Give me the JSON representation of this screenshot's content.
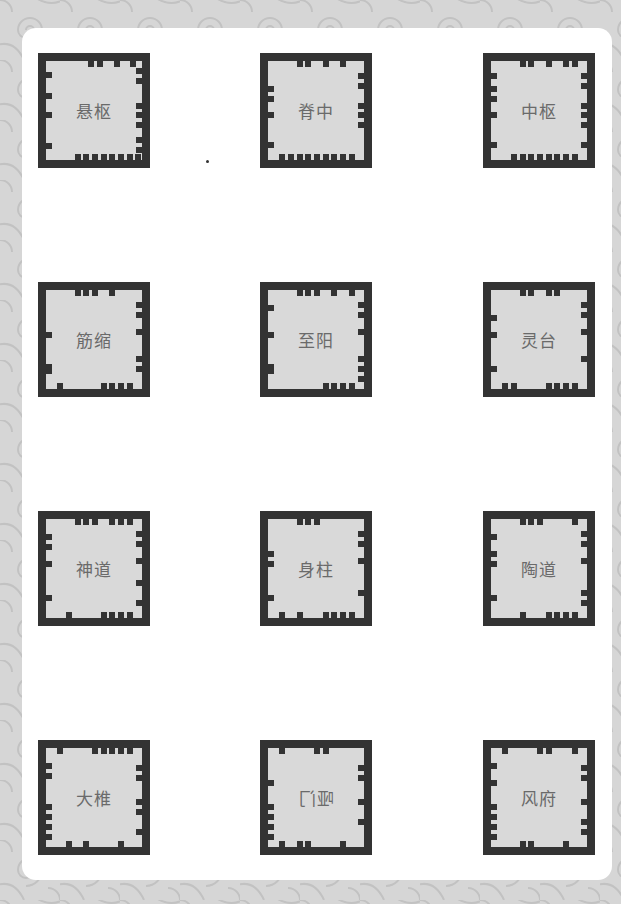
{
  "colors": {
    "background": "#d6d6d6",
    "pattern_stroke": "#c2c2c2",
    "card": "#ffffff",
    "tile_border": "#333333",
    "tile_fill": "#d9d9d9",
    "label_text": "#6a6a6a"
  },
  "grid": {
    "columns": 3,
    "rows": 4,
    "column_lefts": [
      38,
      260,
      483
    ],
    "row_tops": [
      53,
      282,
      511,
      740
    ]
  },
  "tiles": [
    {
      "label": "悬枢",
      "mirrored": false,
      "notches": {
        "top": [
          0.47,
          0.56,
          0.74,
          0.91
        ],
        "bottom": [
          0.33,
          0.42,
          0.51,
          0.6,
          0.69,
          0.78,
          0.87,
          0.96
        ],
        "left": [
          0.14,
          0.35,
          0.55,
          0.86
        ],
        "right": [
          0.1,
          0.2,
          0.45,
          0.55,
          0.65,
          0.8,
          0.9
        ]
      }
    },
    {
      "label": "脊中",
      "mirrored": false,
      "notches": {
        "top": [
          0.33,
          0.42,
          0.6,
          0.78
        ],
        "bottom": [
          0.15,
          0.24,
          0.33,
          0.42,
          0.51,
          0.6,
          0.69,
          0.78,
          0.87
        ],
        "left": [
          0.28,
          0.38,
          0.55,
          0.85
        ],
        "right": [
          0.15,
          0.25,
          0.45,
          0.55,
          0.65
        ]
      }
    },
    {
      "label": "中枢",
      "mirrored": false,
      "notches": {
        "top": [
          0.33,
          0.42,
          0.6,
          0.78,
          0.87
        ],
        "bottom": [
          0.24,
          0.33,
          0.42,
          0.51,
          0.6,
          0.69,
          0.78,
          0.87
        ],
        "left": [
          0.15,
          0.28,
          0.38,
          0.55,
          0.85
        ],
        "right": [
          0.15,
          0.25,
          0.45,
          0.55,
          0.65,
          0.85
        ]
      }
    },
    {
      "label": "筋缩",
      "mirrored": false,
      "notches": {
        "top": [
          0.33,
          0.42,
          0.51,
          0.69
        ],
        "bottom": [
          0.15,
          0.6,
          0.69,
          0.78,
          0.87
        ],
        "left": [
          0.45,
          0.78,
          0.82
        ],
        "right": [
          0.15,
          0.25,
          0.42,
          0.7,
          0.8
        ]
      }
    },
    {
      "label": "至阳",
      "mirrored": false,
      "notches": {
        "top": [
          0.33,
          0.42,
          0.51,
          0.69,
          0.87
        ],
        "bottom": [
          0.6,
          0.69,
          0.78,
          0.87
        ],
        "left": [
          0.18,
          0.45,
          0.78,
          0.82
        ],
        "right": [
          0.15,
          0.25,
          0.42,
          0.7,
          0.8,
          0.9
        ]
      }
    },
    {
      "label": "灵台",
      "mirrored": false,
      "notches": {
        "top": [
          0.33,
          0.42,
          0.6,
          0.69
        ],
        "bottom": [
          0.15,
          0.24,
          0.6,
          0.69,
          0.78,
          0.87
        ],
        "left": [
          0.28,
          0.45,
          0.8
        ],
        "right": [
          0.15,
          0.25,
          0.42,
          0.7
        ]
      }
    },
    {
      "label": "神道",
      "mirrored": false,
      "notches": {
        "top": [
          0.33,
          0.42,
          0.51,
          0.69,
          0.78,
          0.87
        ],
        "bottom": [
          0.24,
          0.6,
          0.69,
          0.78,
          0.87
        ],
        "left": [
          0.18,
          0.28,
          0.45,
          0.8
        ],
        "right": [
          0.15,
          0.25,
          0.42,
          0.65,
          0.85
        ]
      }
    },
    {
      "label": "身柱",
      "mirrored": false,
      "notches": {
        "top": [
          0.33,
          0.42,
          0.51
        ],
        "bottom": [
          0.15,
          0.33,
          0.6,
          0.69,
          0.78,
          0.87
        ],
        "left": [
          0.35,
          0.45,
          0.8
        ],
        "right": [
          0.15,
          0.25,
          0.42,
          0.75
        ]
      }
    },
    {
      "label": "陶道",
      "mirrored": false,
      "notches": {
        "top": [
          0.33,
          0.42,
          0.51,
          0.87
        ],
        "bottom": [
          0.33,
          0.6,
          0.69,
          0.78,
          0.87
        ],
        "left": [
          0.18,
          0.35,
          0.45,
          0.8
        ],
        "right": [
          0.15,
          0.25,
          0.42,
          0.75,
          0.85
        ]
      }
    },
    {
      "label": "大椎",
      "mirrored": false,
      "notches": {
        "top": [
          0.15,
          0.51,
          0.6,
          0.69,
          0.78,
          0.87
        ],
        "bottom": [
          0.24,
          0.42,
          0.78
        ],
        "left": [
          0.18,
          0.28,
          0.6,
          0.7,
          0.8,
          0.9
        ],
        "right": [
          0.2,
          0.3,
          0.55,
          0.65,
          0.85
        ]
      }
    },
    {
      "label": "哑门",
      "mirrored": true,
      "notches": {
        "top": [
          0.15,
          0.51,
          0.6
        ],
        "bottom": [
          0.15,
          0.33,
          0.42,
          0.78
        ],
        "left": [
          0.35,
          0.6,
          0.7,
          0.8,
          0.9
        ],
        "right": [
          0.2,
          0.3,
          0.55,
          0.75
        ]
      }
    },
    {
      "label": "风府",
      "mirrored": false,
      "notches": {
        "top": [
          0.15,
          0.51,
          0.6,
          0.87
        ],
        "bottom": [
          0.33,
          0.42,
          0.78
        ],
        "left": [
          0.18,
          0.35,
          0.6,
          0.7,
          0.8,
          0.9
        ],
        "right": [
          0.2,
          0.3,
          0.55,
          0.75,
          0.85
        ]
      }
    }
  ]
}
